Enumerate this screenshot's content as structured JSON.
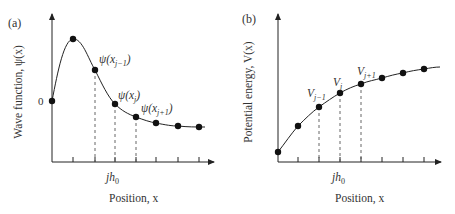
{
  "panels": {
    "a": {
      "tag": "(a)",
      "ylabel": "Wave function, ψ(x)",
      "xlabel": "Position, x",
      "zero_label": "0",
      "tick_label": "jh",
      "tick_label_sub": "0",
      "point_labels": [
        {
          "base": "ψ(x",
          "sub": "j−1",
          "tail": ")"
        },
        {
          "base": "ψ(x",
          "sub": "j",
          "tail": ")"
        },
        {
          "base": "ψ(x",
          "sub": "j+1",
          "tail": ")"
        }
      ]
    },
    "b": {
      "tag": "(b)",
      "ylabel": "Potential energy, V(x)",
      "xlabel": "Position, x",
      "tick_label": "jh",
      "tick_label_sub": "0",
      "point_labels": [
        {
          "base": "V",
          "sub": "j−1"
        },
        {
          "base": "V",
          "sub": "j"
        },
        {
          "base": "V",
          "sub": "j+1"
        }
      ]
    }
  },
  "colors": {
    "ink": "#222222",
    "dash": "#555555"
  }
}
